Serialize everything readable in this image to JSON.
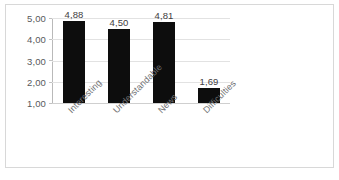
{
  "chart_data": {
    "type": "bar",
    "title": "",
    "subtitle": "",
    "xlabel": "",
    "ylabel": "",
    "categories": [
      "Interesting",
      "Understandable",
      "News",
      "Difficulties"
    ],
    "values": [
      4.88,
      4.5,
      4.81,
      1.69
    ],
    "value_labels": [
      "4,88",
      "4,50",
      "4,81",
      "1,69"
    ],
    "ylim": [
      1,
      5
    ],
    "ytick_labels": [
      "1,00",
      "2,00",
      "3,00",
      "4,00",
      "5,00"
    ],
    "ytick_values": [
      1,
      2,
      3,
      4,
      5
    ],
    "grid": true,
    "legend": false,
    "legend_position": "none",
    "decimal_separator": ",",
    "bar_color": "#0d0d0d",
    "gridline_color": "#e2e2e2",
    "axis_color": "#b9b9b9",
    "label_color": "#58595b"
  }
}
